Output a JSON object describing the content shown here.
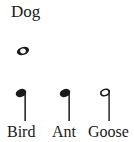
{
  "canvas": {
    "width": 134,
    "height": 142,
    "background_color": "#ffffff",
    "ink_color": "#1a1a1a"
  },
  "title": {
    "text": "Dog"
  },
  "items": [
    {
      "id": "dog",
      "label": "Dog",
      "label_position": "above",
      "note_name": "whole-note",
      "note_symbol": "ᴕD",
      "note_fill": "hollow",
      "has_stem": false
    },
    {
      "id": "bird",
      "label": "Bird",
      "label_position": "below",
      "note_name": "quarter-note",
      "note_symbol": "♩",
      "note_fill": "filled",
      "has_stem": true,
      "stem_side": "right",
      "stem_direction": "down"
    },
    {
      "id": "ant",
      "label": "Ant",
      "label_position": "below",
      "note_name": "quarter-note",
      "note_symbol": "♩",
      "note_fill": "filled",
      "has_stem": true,
      "stem_side": "right",
      "stem_direction": "down"
    },
    {
      "id": "goose",
      "label": "Goose",
      "label_position": "below",
      "note_name": "half-note",
      "note_symbol": "ᴕE",
      "note_fill": "hollow",
      "has_stem": true,
      "stem_side": "right",
      "stem_direction": "down"
    }
  ],
  "labels": {
    "dog": "Dog",
    "bird": "Bird",
    "ant": "Ant",
    "goose": "Goose"
  }
}
